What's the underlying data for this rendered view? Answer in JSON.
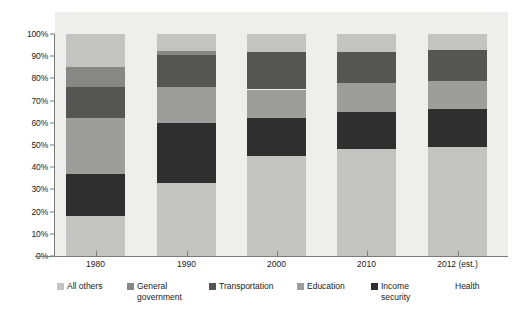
{
  "chart_data": {
    "type": "bar",
    "subtype": "stacked-percentage-bar",
    "title": "",
    "subtitle": "",
    "xlabel": "",
    "ylabel": "",
    "categories": [
      "1980",
      "1990",
      "2000",
      "2010",
      "2012 (est.)"
    ],
    "ylim": [
      0,
      100
    ],
    "y_tick_labels": [
      "0%",
      "10%",
      "20%",
      "30%",
      "40%",
      "50%",
      "60%",
      "70%",
      "80%",
      "90%",
      "100%"
    ],
    "y_tick_values": [
      0,
      10,
      20,
      30,
      40,
      50,
      60,
      70,
      80,
      90,
      100
    ],
    "grid": false,
    "legend_position": "bottom",
    "stack_order_bottom_to_top": [
      "Health",
      "Income security",
      "Education",
      "Transportation",
      "General government",
      "All others"
    ],
    "series": [
      {
        "name": "Health",
        "color": "#c3c3c1",
        "values": [
          18,
          33,
          45,
          48,
          49
        ]
      },
      {
        "name": "Income security",
        "color": "#2f2f2f",
        "values": [
          19,
          27,
          17,
          17,
          17
        ]
      },
      {
        "name": "Education",
        "color": "#9d9d9b",
        "values": [
          25,
          16,
          13,
          13,
          13
        ]
      },
      {
        "name": "Transportation",
        "color": "#555553",
        "values": [
          14,
          14.5,
          17,
          14,
          14
        ]
      },
      {
        "name": "General government",
        "color": "#878785",
        "values": [
          9,
          2,
          0,
          0,
          0
        ]
      },
      {
        "name": "All others",
        "color": "#c3c3c1",
        "values": [
          15,
          7.5,
          8,
          8,
          7
        ]
      }
    ]
  },
  "legend": {
    "items": [
      {
        "label": "All others",
        "color": "#c3c3c1",
        "has_swatch": true
      },
      {
        "label": "General\ngovernment",
        "color": "#878785",
        "has_swatch": true
      },
      {
        "label": "Transportation",
        "color": "#555553",
        "has_swatch": true
      },
      {
        "label": "Education",
        "color": "#9d9d9b",
        "has_swatch": true
      },
      {
        "label": "Income\nsecurity",
        "color": "#2f2f2f",
        "has_swatch": true
      },
      {
        "label": "Health",
        "color": "#c3c3c1",
        "has_swatch": false
      }
    ]
  },
  "colors": {
    "plot_background": "#eeeeec",
    "axis": "#7b7b7b",
    "text": "#1a1a1a"
  }
}
